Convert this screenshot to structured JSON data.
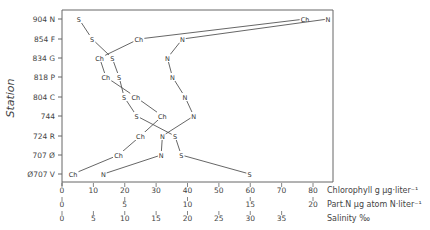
{
  "chart_data": {
    "type": "line",
    "title": "",
    "ylabel": "Station",
    "categories": [
      "904 N",
      "854 F",
      "834 G",
      "818  P",
      "804 C",
      "744",
      "724 R",
      "707 Ø",
      "Ø707 V"
    ],
    "x_axes": [
      {
        "label": "Chlorophyll g µg·liter⁻¹",
        "ticks": [
          0,
          10,
          20,
          30,
          40,
          50,
          60,
          70,
          80
        ],
        "range": [
          0,
          80
        ]
      },
      {
        "label": "Part.N µg atom N·liter⁻¹",
        "ticks": [
          0,
          5,
          10,
          15,
          20
        ],
        "range": [
          0,
          20
        ]
      },
      {
        "label": "Salinity ‰",
        "ticks": [
          0,
          5,
          10,
          15,
          20,
          25,
          30,
          35
        ],
        "range": [
          0,
          40
        ]
      }
    ],
    "series": [
      {
        "name": "Chlorophyll",
        "marker": "Ch",
        "axis": 0,
        "values": [
          77.5,
          24.5,
          12,
          14,
          23.5,
          32,
          25,
          18,
          3.5
        ]
      },
      {
        "name": "Part.N",
        "marker": "N",
        "axis": 1,
        "values": [
          21.2,
          9.6,
          8.4,
          8.8,
          9.8,
          10.5,
          8.0,
          7.9,
          3.3
        ]
      },
      {
        "name": "Salinity",
        "marker": "S",
        "axis": 2,
        "values": [
          2.7,
          4.8,
          8.0,
          9.1,
          9.9,
          11.9,
          18,
          19,
          29.9
        ]
      }
    ],
    "grid": false,
    "legend": "none"
  },
  "labels": {
    "y_title": "Station",
    "axis1": "Chlorophyll g µg·liter⁻¹",
    "axis2": "Part.N µg atom N·liter⁻¹",
    "axis3": "Salinity ‰"
  }
}
